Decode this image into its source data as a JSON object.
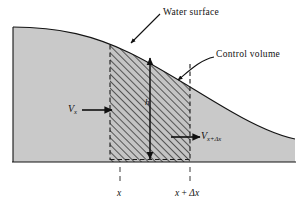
{
  "figure": {
    "type": "technical-diagram",
    "labels": {
      "water_surface": "Water surface",
      "control_volume": "Control volume",
      "velocity_in": "V",
      "velocity_in_sub": "x",
      "velocity_out": "V",
      "velocity_out_sub": "x+Δx",
      "depth": "h",
      "axis_left": "x",
      "axis_right_var": "x",
      "axis_right_op": " + ",
      "axis_right_delta": "Δx"
    },
    "colors": {
      "water_fill": "#c9c9c9",
      "hatch_fill": "#c4c4c4",
      "hatch_stroke": "#2a2a2a",
      "outline": "#1a1a1a",
      "text": "#111111",
      "background": "#ffffff"
    },
    "geometry": {
      "ground_line_y": 162,
      "water_left_x": 13,
      "water_right_x": 295,
      "cv_left_x": 110,
      "cv_right_x": 190,
      "cv_top_left_y": 45,
      "cv_top_right_y": 64,
      "depth_arrow_x": 150,
      "surface_crest_y": 27
    }
  }
}
